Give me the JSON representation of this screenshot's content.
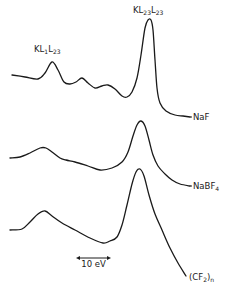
{
  "chart_data": {
    "type": "line",
    "title": "",
    "xlabel": "",
    "ylabel": "",
    "grid": false,
    "legend": "inline labels at right end of each curve",
    "annotations": [
      {
        "text": "KL1L23",
        "main": "KL",
        "parts": [
          {
            "sub": "1"
          },
          {
            "main": "L"
          },
          {
            "sub": "23"
          }
        ],
        "near_series": "NaF",
        "x": 34,
        "y": 52
      },
      {
        "text": "KL23L23",
        "main": "KL",
        "parts": [
          {
            "sub": "23"
          },
          {
            "main": "L"
          },
          {
            "sub": "23"
          }
        ],
        "near_series": "NaF",
        "x": 133,
        "y": 13
      }
    ],
    "scale_bar": {
      "label": "10 eV",
      "x1": 76,
      "x2": 111,
      "y": 258
    },
    "series": [
      {
        "name": "NaF",
        "label_main": "NaF",
        "label_sub": "",
        "label_main2": "",
        "points": [
          [
            12,
            75
          ],
          [
            25,
            77
          ],
          [
            38,
            79
          ],
          [
            45,
            73
          ],
          [
            52,
            62
          ],
          [
            58,
            70
          ],
          [
            64,
            82
          ],
          [
            70,
            84
          ],
          [
            76,
            82
          ],
          [
            82,
            78
          ],
          [
            88,
            83
          ],
          [
            95,
            88
          ],
          [
            102,
            86
          ],
          [
            108,
            85
          ],
          [
            115,
            89
          ],
          [
            122,
            96
          ],
          [
            127,
            97
          ],
          [
            132,
            92
          ],
          [
            137,
            78
          ],
          [
            141,
            55
          ],
          [
            145,
            28
          ],
          [
            148,
            20
          ],
          [
            151,
            20
          ],
          [
            153,
            30
          ],
          [
            155,
            60
          ],
          [
            157,
            88
          ],
          [
            160,
            103
          ],
          [
            166,
            111
          ],
          [
            175,
            115
          ],
          [
            183,
            116
          ],
          [
            190,
            117
          ]
        ],
        "label_x": 193,
        "label_y": 120
      },
      {
        "name": "NaBF4",
        "label_main": "NaBF",
        "label_sub": "4",
        "label_main2": "",
        "points": [
          [
            10,
            158
          ],
          [
            20,
            157
          ],
          [
            30,
            153
          ],
          [
            40,
            148
          ],
          [
            46,
            148
          ],
          [
            52,
            152
          ],
          [
            60,
            158
          ],
          [
            66,
            160
          ],
          [
            75,
            162
          ],
          [
            88,
            166
          ],
          [
            100,
            170
          ],
          [
            112,
            168
          ],
          [
            122,
            162
          ],
          [
            128,
            152
          ],
          [
            133,
            136
          ],
          [
            137,
            125
          ],
          [
            141,
            121
          ],
          [
            145,
            126
          ],
          [
            149,
            140
          ],
          [
            153,
            155
          ],
          [
            158,
            166
          ],
          [
            165,
            174
          ],
          [
            172,
            180
          ],
          [
            180,
            184
          ],
          [
            190,
            186
          ]
        ],
        "label_x": 193,
        "label_y": 189
      },
      {
        "name": "(CF2)n",
        "label_main": "(CF",
        "label_sub": "2",
        "label_main2": ")n",
        "points": [
          [
            10,
            230
          ],
          [
            22,
            229
          ],
          [
            30,
            222
          ],
          [
            38,
            214
          ],
          [
            45,
            211
          ],
          [
            52,
            216
          ],
          [
            62,
            223
          ],
          [
            75,
            230
          ],
          [
            90,
            238
          ],
          [
            103,
            243
          ],
          [
            110,
            241
          ],
          [
            117,
            237
          ],
          [
            122,
            225
          ],
          [
            127,
            205
          ],
          [
            132,
            184
          ],
          [
            136,
            172
          ],
          [
            140,
            169
          ],
          [
            144,
            176
          ],
          [
            149,
            195
          ],
          [
            155,
            214
          ],
          [
            162,
            230
          ],
          [
            170,
            248
          ],
          [
            178,
            263
          ],
          [
            186,
            276
          ]
        ],
        "label_x": 189,
        "label_y": 280
      }
    ]
  }
}
